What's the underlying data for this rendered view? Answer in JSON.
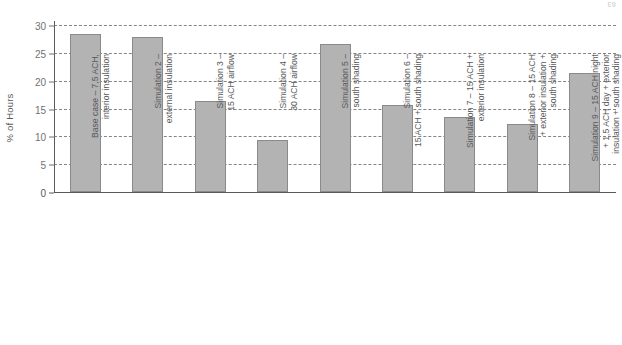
{
  "page": {
    "corner_mark": "63"
  },
  "chart_data": {
    "type": "bar",
    "title": "",
    "subtitle": "",
    "xlabel": "",
    "ylabel": "% of Hours",
    "ylim": [
      0,
      30
    ],
    "yticks": [
      0,
      5,
      10,
      15,
      20,
      25,
      30
    ],
    "ytick_labels": [
      "0",
      "5",
      "10",
      "15",
      "20",
      "25",
      "30"
    ],
    "grid": true,
    "grid_style": "dashed-horizontal",
    "legend": "none",
    "bar_color": "#b3b3b3",
    "bar_edge_color": "#888a8c",
    "axis_color": "#58595b",
    "categories": [
      "Base case – 7,5 ACH,\ninterior insulation",
      "Simulation 2 –\nexternal insulation",
      "Simulation 3 –\n15 ACH airflow",
      "Simulation 4 –\n30 ACH airflow",
      "Simulation 5 –\nsouth shading",
      "Simulation 6 –\n15 ACH + south shading",
      "Simulation 7 – 15 ACH +\nexterior insulation",
      "Simulation 8 – 15 ACH\n+ exterior insulation +\nsouth shading",
      "Simulation 9 – 15 ACH night\n+ 1,5 ACH day + exterior\ninsulation + south shading"
    ],
    "values": [
      28.3,
      27.9,
      16.3,
      9.4,
      26.6,
      15.7,
      13.4,
      12.2,
      21.3
    ]
  }
}
